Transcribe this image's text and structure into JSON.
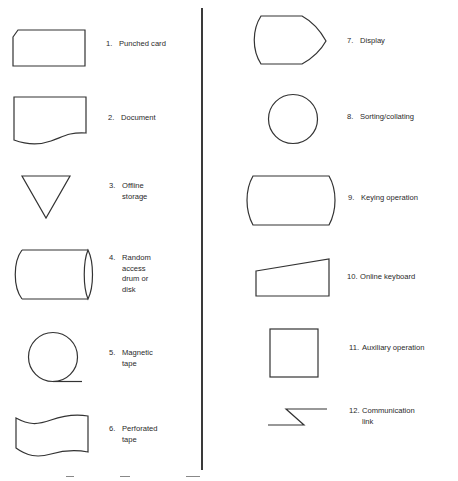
{
  "symbols": [
    {
      "num": "1.",
      "label": "Punched card",
      "icon": "punched-card-symbol"
    },
    {
      "num": "2.",
      "label": "Document",
      "icon": "document-symbol"
    },
    {
      "num": "3.",
      "label": "Offline\nstorage",
      "icon": "offline-storage-symbol"
    },
    {
      "num": "4.",
      "label": "Random\naccess\ndrum or\ndisk",
      "icon": "random-access-drum-symbol"
    },
    {
      "num": "5.",
      "label": "Magnetic\ntape",
      "icon": "magnetic-tape-symbol"
    },
    {
      "num": "6.",
      "label": "Perforated\ntape",
      "icon": "perforated-tape-symbol"
    },
    {
      "num": "7.",
      "label": "Display",
      "icon": "display-symbol"
    },
    {
      "num": "8.",
      "label": "Sorting/collating",
      "icon": "sorting-collating-symbol"
    },
    {
      "num": "9.",
      "label": "Keying operation",
      "icon": "keying-operation-symbol"
    },
    {
      "num": "10.",
      "label": "Online keyboard",
      "icon": "online-keyboard-symbol"
    },
    {
      "num": "11.",
      "label": "Auxiliary operation",
      "icon": "auxiliary-operation-symbol"
    },
    {
      "num": "12.",
      "label": "Communication\nlink",
      "icon": "communication-link-symbol"
    }
  ],
  "colors": {
    "stroke": "#333333",
    "text": "#2a2a2a",
    "background": "#ffffff"
  }
}
